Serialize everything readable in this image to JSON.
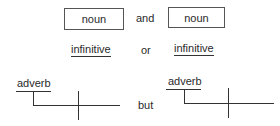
{
  "row1": {
    "left_box": "noun",
    "connector": "and",
    "right_box": "noun"
  },
  "row2": {
    "left": "infinitive",
    "connector": "or",
    "right": "infinitive"
  },
  "row3": {
    "left_diagram": {
      "modifier": "adverb"
    },
    "connector": "but",
    "right_diagram": {
      "modifier": "adverb"
    }
  },
  "colors": {
    "line": "#333333",
    "text": "#2a2a2a",
    "box_border": "#555555"
  }
}
